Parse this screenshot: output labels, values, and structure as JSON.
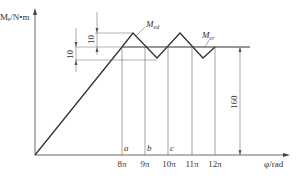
{
  "axes": {
    "y_label": "Mₑ/N•m",
    "x_label": "φ/rad"
  },
  "curves": {
    "drive_label": "M_ed",
    "drive_label_main": "M",
    "drive_label_sub": "ed",
    "resist_label_main": "M",
    "resist_label_sub": "er"
  },
  "dimensions": {
    "upper": "10",
    "lower": "10",
    "height": "160"
  },
  "points": {
    "a": "a",
    "b": "b",
    "c": "c"
  },
  "x_ticks": [
    "8π",
    "9π",
    "10π",
    "11π",
    "12π"
  ],
  "colors": {
    "line": "#333333",
    "thin": "#555555"
  }
}
